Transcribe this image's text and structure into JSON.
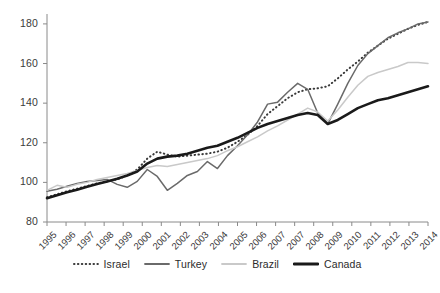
{
  "chart_data": {
    "type": "line",
    "title": "",
    "subtitle": "",
    "xlabel": "",
    "ylabel": "",
    "xlim": [
      1995,
      2014
    ],
    "ylim": [
      80,
      185
    ],
    "grid": false,
    "legend_position": "bottom",
    "y_ticks": [
      80,
      100,
      120,
      140,
      160,
      180
    ],
    "x_tick_labels": [
      "1995",
      "1996",
      "1997",
      "1998",
      "1999",
      "2000",
      "2001",
      "2002",
      "2003",
      "2004",
      "2005",
      "2006",
      "2007",
      "2007",
      "2008",
      "2009",
      "2010",
      "2011",
      "2012",
      "2013",
      "2014"
    ],
    "x": [
      1995,
      1995.5,
      1996,
      1996.5,
      1997,
      1997.5,
      1998,
      1998.5,
      1999,
      1999.5,
      2000,
      2000.5,
      2001,
      2001.5,
      2002,
      2002.5,
      2003,
      2003.5,
      2004,
      2004.5,
      2005,
      2005.5,
      2006,
      2006.5,
      2007,
      2007.5,
      2008,
      2008.5,
      2009,
      2009.5,
      2010,
      2010.5,
      2011,
      2011.5,
      2012,
      2012.5,
      2013,
      2013.5,
      2014
    ],
    "series": [
      {
        "name": "Israel",
        "style": "dotted",
        "color": "#3a3a3a",
        "values": [
          92.5,
          94.0,
          95.5,
          96.8,
          98.2,
          99.5,
          100.5,
          101.5,
          103.5,
          106.5,
          112.0,
          115.5,
          114.0,
          113.0,
          113.5,
          114.0,
          114.5,
          115.5,
          117.5,
          120.5,
          124.0,
          128.5,
          134.5,
          138.5,
          142.5,
          145.5,
          147.0,
          147.5,
          148.5,
          152.5,
          157.0,
          161.0,
          165.5,
          169.0,
          172.5,
          175.0,
          177.5,
          179.5,
          181.0
        ]
      },
      {
        "name": "Turkey",
        "style": "solid",
        "color": "#6a6a6a",
        "values": [
          95.5,
          96.5,
          98.0,
          99.5,
          100.5,
          101.0,
          101.5,
          99.0,
          97.5,
          100.5,
          106.5,
          103.0,
          96.0,
          99.5,
          103.5,
          105.5,
          110.5,
          107.0,
          113.5,
          118.5,
          124.0,
          130.5,
          139.5,
          140.5,
          145.5,
          150.0,
          147.0,
          135.0,
          129.5,
          139.5,
          150.0,
          159.0,
          165.0,
          169.0,
          173.0,
          175.5,
          177.5,
          180.0,
          181.0
        ]
      },
      {
        "name": "Brazil",
        "style": "solid",
        "color": "#c9c9c9",
        "values": [
          96.0,
          98.5,
          97.5,
          99.0,
          100.0,
          101.5,
          102.5,
          103.5,
          104.5,
          106.0,
          107.5,
          108.5,
          108.0,
          109.0,
          110.0,
          111.0,
          112.0,
          113.5,
          116.0,
          118.0,
          120.5,
          123.0,
          126.0,
          128.5,
          131.5,
          134.5,
          137.5,
          135.5,
          131.0,
          136.5,
          143.0,
          149.0,
          153.5,
          155.5,
          157.0,
          158.5,
          160.5,
          160.5,
          160.0
        ]
      },
      {
        "name": "Canada",
        "style": "solid-thick",
        "color": "#1a1a1a",
        "values": [
          92.0,
          93.5,
          95.0,
          96.3,
          97.8,
          99.2,
          100.5,
          101.8,
          103.5,
          105.5,
          109.5,
          112.0,
          113.0,
          113.5,
          114.5,
          116.0,
          117.5,
          118.5,
          120.5,
          122.5,
          125.0,
          127.5,
          129.5,
          131.0,
          132.5,
          134.0,
          135.0,
          134.0,
          129.5,
          131.5,
          134.5,
          137.5,
          139.5,
          141.5,
          142.5,
          144.0,
          145.5,
          147.0,
          148.5
        ]
      }
    ]
  },
  "legend": {
    "items": [
      {
        "label": "Israel"
      },
      {
        "label": "Turkey"
      },
      {
        "label": "Brazil"
      },
      {
        "label": "Canada"
      }
    ]
  }
}
